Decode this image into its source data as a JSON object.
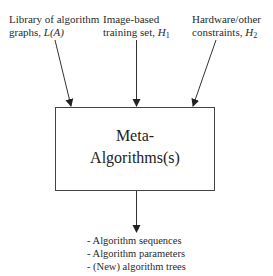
{
  "inputs": [
    {
      "line1": "Library of algorithm",
      "line2_prefix": "graphs, ",
      "symbol": "L(A)",
      "sub": ""
    },
    {
      "line1": "Image-based",
      "line2_prefix": "training set, ",
      "symbol": "H",
      "sub": "1"
    },
    {
      "line1": "Hardware/other",
      "line2_prefix": "constraints, ",
      "symbol": "H",
      "sub": "2"
    }
  ],
  "box": {
    "line1": "Meta-",
    "line2": "Algorithms(s)"
  },
  "outputs": [
    "- Algorithm sequences",
    "- Algorithm parameters",
    "- (New) algorithm trees"
  ],
  "colors": {
    "line": "#333333",
    "text": "#2a2a2a",
    "background": "#ffffff"
  }
}
